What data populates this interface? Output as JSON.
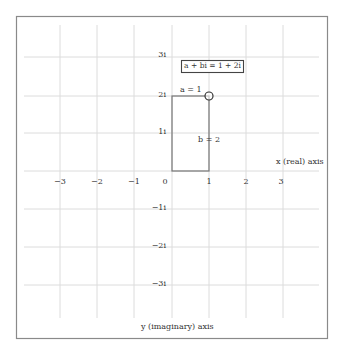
{
  "figure": {
    "equation_label": "a + bi = 1 + 2i",
    "a_label": "a = 1",
    "b_label": "b = 2",
    "x_axis_label": "x (real) axis",
    "y_axis_label": "y (imaginary) axis",
    "point": {
      "real": 1,
      "imaginary": 2
    },
    "x_ticks": [
      "−3",
      "−2",
      "−1",
      "0",
      "1",
      "2",
      "3"
    ],
    "y_ticks": [
      "3i",
      "2i",
      "1i",
      "−1i",
      "−2i",
      "−3i"
    ],
    "colors": {
      "frame": "#8a8a8a",
      "grid": "#dcdcdc",
      "shape": "#777777",
      "text": "#333333"
    }
  }
}
